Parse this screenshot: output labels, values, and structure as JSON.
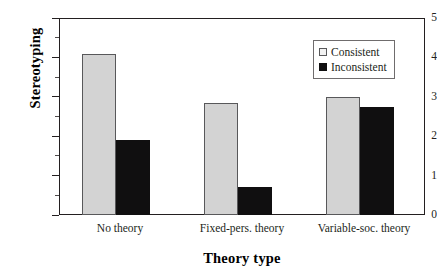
{
  "chart_data": {
    "type": "bar",
    "title": "",
    "xlabel": "Theory type",
    "ylabel": "Stereotyping",
    "categories": [
      "No theory",
      "Fixed-pers. theory",
      "Variable-soc. theory"
    ],
    "series": [
      {
        "name": "Consistent",
        "values": [
          4.08,
          2.84,
          3.0
        ],
        "color": "#d3d3d3"
      },
      {
        "name": "Inconsistent",
        "values": [
          1.9,
          0.71,
          2.74
        ],
        "color": "#100f10"
      }
    ],
    "ylim": [
      0,
      5
    ],
    "y_major_ticks": [
      0,
      1,
      2,
      3,
      4,
      5
    ],
    "y_tick_labels": [
      "0",
      "1",
      "2",
      "3",
      "4",
      "5"
    ],
    "y_minor_ticks": [
      0.5,
      1.5,
      2.5,
      3.5,
      4.5
    ],
    "grid": false,
    "legend_position": "upper-right",
    "legend_entries": [
      "Consistent",
      "Inconsistent"
    ]
  },
  "axes": {
    "y_title": "Stereotyping",
    "x_title": "Theory type"
  }
}
